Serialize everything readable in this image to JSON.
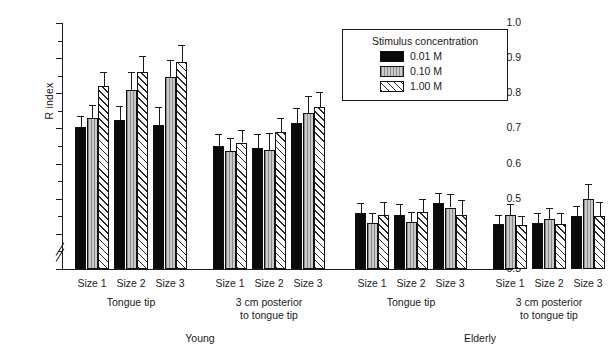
{
  "chart_data": {
    "type": "bar",
    "title": "",
    "xlabel": "",
    "ylabel": "R index",
    "ylim": [
      0.3,
      1.0
    ],
    "y_break_below": 0.3,
    "grid": false,
    "ytick_labels": [
      "0.3",
      "0.4",
      "0.5",
      "0.6",
      "0.7",
      "0.8",
      "0.9",
      "1.0"
    ],
    "ytick_values": [
      0.3,
      0.4,
      0.5,
      0.6,
      0.7,
      0.8,
      0.9,
      1.0
    ],
    "minor_tick_step": 0.05,
    "legend": {
      "title": "Stimulus concentration",
      "position": "top-right",
      "entries": [
        {
          "label": "0.01 M",
          "fill": "solid-black",
          "color": "#0a0a0a"
        },
        {
          "label": "0.10 M",
          "fill": "light-gray-vertical-lines",
          "color": "#c9c9c9"
        },
        {
          "label": "1.00 M",
          "fill": "diagonal-hatch",
          "color": "#ffffff"
        }
      ]
    },
    "categories": [
      "Size 1",
      "Size 2",
      "Size 3"
    ],
    "groups": [
      {
        "age": "Young",
        "location": "Tongue tip",
        "location_lines": [
          "Tongue tip"
        ],
        "bars": [
          {
            "category": "Size 1",
            "series": "0.01 M",
            "value": 0.705,
            "error": 0.03
          },
          {
            "category": "Size 1",
            "series": "0.10 M",
            "value": 0.73,
            "error": 0.037
          },
          {
            "category": "Size 1",
            "series": "1.00 M",
            "value": 0.82,
            "error": 0.04
          },
          {
            "category": "Size 2",
            "series": "0.01 M",
            "value": 0.725,
            "error": 0.04
          },
          {
            "category": "Size 2",
            "series": "0.10 M",
            "value": 0.81,
            "error": 0.05
          },
          {
            "category": "Size 2",
            "series": "1.00 M",
            "value": 0.86,
            "error": 0.045
          },
          {
            "category": "Size 3",
            "series": "0.01 M",
            "value": 0.71,
            "error": 0.05
          },
          {
            "category": "Size 3",
            "series": "0.10 M",
            "value": 0.845,
            "error": 0.05
          },
          {
            "category": "Size 3",
            "series": "1.00 M",
            "value": 0.89,
            "error": 0.048
          }
        ]
      },
      {
        "age": "Young",
        "location": "3 cm posterior to tongue tip",
        "location_lines": [
          "3 cm posterior",
          "to tongue tip"
        ],
        "bars": [
          {
            "category": "Size 1",
            "series": "0.01 M",
            "value": 0.65,
            "error": 0.035
          },
          {
            "category": "Size 1",
            "series": "0.10 M",
            "value": 0.635,
            "error": 0.038
          },
          {
            "category": "Size 1",
            "series": "1.00 M",
            "value": 0.66,
            "error": 0.035
          },
          {
            "category": "Size 2",
            "series": "0.01 M",
            "value": 0.645,
            "error": 0.04
          },
          {
            "category": "Size 2",
            "series": "0.10 M",
            "value": 0.64,
            "error": 0.047
          },
          {
            "category": "Size 2",
            "series": "1.00 M",
            "value": 0.69,
            "error": 0.04
          },
          {
            "category": "Size 3",
            "series": "0.01 M",
            "value": 0.715,
            "error": 0.042
          },
          {
            "category": "Size 3",
            "series": "0.10 M",
            "value": 0.745,
            "error": 0.048
          },
          {
            "category": "Size 3",
            "series": "1.00 M",
            "value": 0.76,
            "error": 0.045
          }
        ]
      },
      {
        "age": "Elderly",
        "location": "Tongue tip",
        "location_lines": [
          "Tongue tip"
        ],
        "bars": [
          {
            "category": "Size 1",
            "series": "0.01 M",
            "value": 0.458,
            "error": 0.03
          },
          {
            "category": "Size 1",
            "series": "0.10 M",
            "value": 0.43,
            "error": 0.028
          },
          {
            "category": "Size 1",
            "series": "1.00 M",
            "value": 0.455,
            "error": 0.035
          },
          {
            "category": "Size 2",
            "series": "0.01 M",
            "value": 0.455,
            "error": 0.03
          },
          {
            "category": "Size 2",
            "series": "0.10 M",
            "value": 0.435,
            "error": 0.028
          },
          {
            "category": "Size 2",
            "series": "1.00 M",
            "value": 0.462,
            "error": 0.038
          },
          {
            "category": "Size 3",
            "series": "0.01 M",
            "value": 0.487,
            "error": 0.03
          },
          {
            "category": "Size 3",
            "series": "0.10 M",
            "value": 0.475,
            "error": 0.038
          },
          {
            "category": "Size 3",
            "series": "1.00 M",
            "value": 0.455,
            "error": 0.04
          }
        ]
      },
      {
        "age": "Elderly",
        "location": "3 cm posterior to tongue tip",
        "location_lines": [
          "3 cm posterior",
          "to tongue tip"
        ],
        "bars": [
          {
            "category": "Size 1",
            "series": "0.01 M",
            "value": 0.428,
            "error": 0.025
          },
          {
            "category": "Size 1",
            "series": "0.10 M",
            "value": 0.455,
            "error": 0.03
          },
          {
            "category": "Size 1",
            "series": "1.00 M",
            "value": 0.425,
            "error": 0.025
          },
          {
            "category": "Size 2",
            "series": "0.01 M",
            "value": 0.432,
            "error": 0.028
          },
          {
            "category": "Size 2",
            "series": "0.10 M",
            "value": 0.443,
            "error": 0.03
          },
          {
            "category": "Size 2",
            "series": "1.00 M",
            "value": 0.428,
            "error": 0.03
          },
          {
            "category": "Size 3",
            "series": "0.01 M",
            "value": 0.45,
            "error": 0.03
          },
          {
            "category": "Size 3",
            "series": "0.10 M",
            "value": 0.498,
            "error": 0.045
          },
          {
            "category": "Size 3",
            "series": "1.00 M",
            "value": 0.452,
            "error": 0.04
          }
        ]
      }
    ],
    "age_labels": [
      "Young",
      "Elderly"
    ]
  }
}
